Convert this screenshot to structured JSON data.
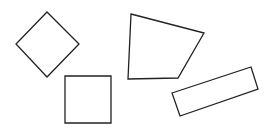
{
  "canvas": {
    "width": 270,
    "height": 131,
    "background": "#ffffff"
  },
  "style": {
    "stroke": "#222222",
    "stroke_width": 1.3,
    "fill": "none"
  },
  "shapes": [
    {
      "name": "diamond",
      "points": "47,12 79,44 47,77 16,44"
    },
    {
      "name": "square",
      "points": "65,76 111,76 111,123 65,123"
    },
    {
      "name": "quadrilateral",
      "points": "131,14 204,33 178,78 128,79"
    },
    {
      "name": "tilted-rectangle",
      "points": "172,93 251,67 258,89 180,116"
    }
  ]
}
